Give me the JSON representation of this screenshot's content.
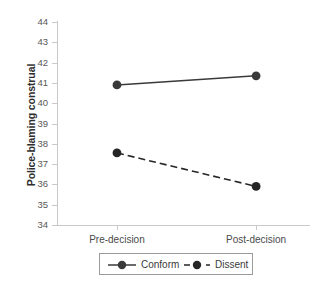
{
  "chart_data": {
    "type": "line",
    "title": "",
    "subtitle": "",
    "xlabel": "",
    "ylabel": "Police-blaming construal",
    "categories": [
      "Pre-decision",
      "Post-decision"
    ],
    "ylim": [
      34,
      44
    ],
    "ytick_labels": [
      "34",
      "35",
      "36",
      "37",
      "38",
      "39",
      "40",
      "41",
      "42",
      "43",
      "44"
    ],
    "ytick_values": [
      34,
      35,
      36,
      37,
      38,
      39,
      40,
      41,
      42,
      43,
      44
    ],
    "grid": false,
    "legend_position": "below-axis-center",
    "series": [
      {
        "name": "Conform",
        "values": [
          40.9,
          41.35
        ],
        "linestyle": "solid",
        "marker": "circle",
        "color": "#3a3a3a"
      },
      {
        "name": "Dissent",
        "values": [
          37.55,
          35.9
        ],
        "linestyle": "dashed",
        "marker": "circle",
        "color": "#262626"
      }
    ],
    "annotations": []
  },
  "axis": {
    "ylabel": "Police-blaming construal",
    "line_color": "#c9c9c9",
    "tick_label_color": "#585858"
  },
  "legend": {
    "items": [
      {
        "label": "Conform",
        "style": "solid"
      },
      {
        "label": "Dissent",
        "style": "dashed"
      }
    ],
    "border_color": "#9a9a9a"
  }
}
